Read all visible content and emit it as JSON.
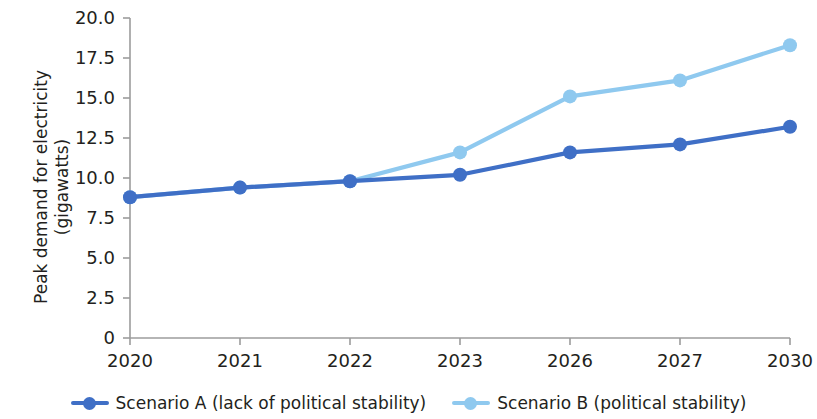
{
  "chart_data": {
    "type": "line",
    "title": "",
    "xlabel": "",
    "ylabel": "Peak demand for electricity\n(gigawatts)",
    "categories": [
      "2020",
      "2021",
      "2022",
      "2023",
      "2026",
      "2027",
      "2030"
    ],
    "ylim": [
      0,
      20
    ],
    "ytick_labels": [
      "0",
      "2.5",
      "5.0",
      "7.5",
      "10.0",
      "12.5",
      "15.0",
      "17.5",
      "20.0"
    ],
    "ytick_values": [
      0,
      2.5,
      5,
      7.5,
      10,
      12.5,
      15,
      17.5,
      20
    ],
    "grid": false,
    "legend_position": "bottom",
    "series": [
      {
        "name": "Scenario A (lack of political stability)",
        "color": "#3f6fc6",
        "values": [
          8.8,
          9.4,
          9.8,
          10.2,
          11.6,
          12.1,
          13.2
        ]
      },
      {
        "name": "Scenario B (political stability)",
        "color": "#8fc9ef",
        "values": [
          8.8,
          9.4,
          9.8,
          11.6,
          15.1,
          16.1,
          18.3
        ]
      }
    ]
  },
  "axis": {
    "line_color": "#9c9c9c"
  },
  "legend": {
    "items": [
      {
        "label": "Scenario A (lack of political stability)",
        "color": "#3f6fc6",
        "marker": "line-with-circle-marker"
      },
      {
        "label": "Scenario B (political stability)",
        "color": "#8fc9ef",
        "marker": "line-with-circle-marker"
      }
    ]
  }
}
